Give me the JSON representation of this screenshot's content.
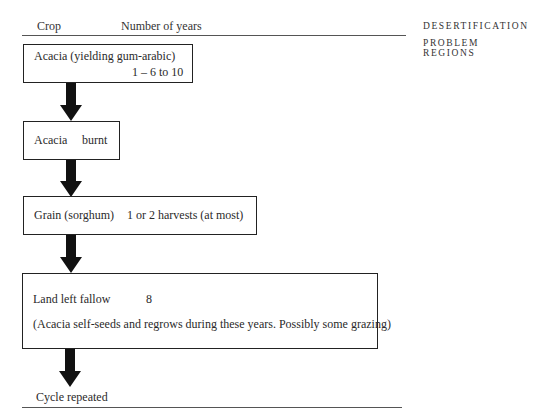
{
  "header": {
    "col_crop": "Crop",
    "col_years": "Number of years"
  },
  "side_title": {
    "line1": "DESERTIFICATION",
    "line2": "PROBLEM REGIONS"
  },
  "steps": [
    {
      "crop": "Acacia (yielding gum-arabic)",
      "years": "1 – 6 to 10"
    },
    {
      "crop": "Acacia",
      "years": "burnt"
    },
    {
      "crop": "Grain (sorghum)",
      "years": "1 or 2 harvests (at most)"
    },
    {
      "crop": "Land left fallow",
      "years": "8",
      "note": "(Acacia self-seeds and regrows during these years. Possibly some grazing)"
    }
  ],
  "footer": {
    "final": "Cycle repeated"
  }
}
